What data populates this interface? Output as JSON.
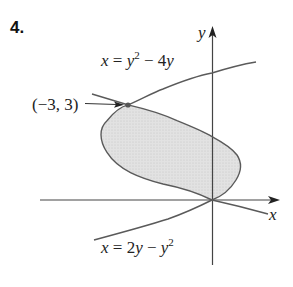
{
  "problem_number": "4.",
  "diagram": {
    "type": "region-between-curves",
    "axes": {
      "x_label": "x",
      "y_label": "y"
    },
    "curves": [
      {
        "name": "upper-parabola",
        "equation_label": "x = y² − 4y",
        "lhs": "x = y",
        "exp": "2",
        "rhs": " − 4y"
      },
      {
        "name": "lower-parabola",
        "equation_label": "x = 2y − y²",
        "lhs": "x = 2y − y",
        "exp": "2"
      }
    ],
    "intersection_points": [
      {
        "label": "(−3, 3)",
        "x": -3,
        "y": 3
      },
      {
        "label": "",
        "x": 0,
        "y": 0
      }
    ],
    "shaded_region": "between x = y² − 4y and x = 2y − y² for 0 ≤ y ≤ 3",
    "colors": {
      "curve": "#5a5a5a",
      "axis": "#333333",
      "fill": "#dcdcdc",
      "point": "#555555"
    }
  }
}
